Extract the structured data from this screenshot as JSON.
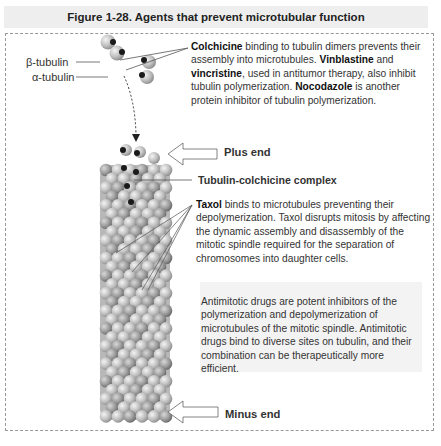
{
  "figure": {
    "title": "Figure 1-28. Agents that prevent microtubular function"
  },
  "labels": {
    "beta_tubulin": "β-tubulin",
    "alpha_tubulin": "α-tubulin",
    "plus_end": "Plus end",
    "tubulin_colchicine_complex": "Tubulin-colchicine complex",
    "minus_end": "Minus end"
  },
  "colchicine_note": {
    "b1": "Colchicine",
    "t1": " binding to tubulin dimers prevents their assembly into microtubules. ",
    "b2": "Vinblastine",
    "t2": " and ",
    "b3": "vincristine",
    "t3": ", used in antitumor therapy, also inhibit tubulin polymerization. ",
    "b4": "Nocodazole",
    "t4": " is another protein inhibitor of tubulin polymerization."
  },
  "taxol_note": {
    "b1": "Taxol",
    "t1": " binds to microtubules preventing their depolymerization. Taxol disrupts mitosis by affecting the dynamic assembly and disassembly of the mitotic spindle required for the separation of chromosomes into daughter cells."
  },
  "antimitotic_note": {
    "text": "Antimitotic drugs are potent inhibitors of the polymerization and depolymerization of microtubules of the mitotic spindle. Antimitotic drugs bind to diverse sites on tubulin, and their combination can be therapeutically more efficient."
  },
  "colors": {
    "title_bg": "#eeeeee",
    "sphere_light": "#d0d0d0",
    "sphere_dark": "#8a8a8a",
    "colchicine_dot": "#1a1a1a"
  }
}
